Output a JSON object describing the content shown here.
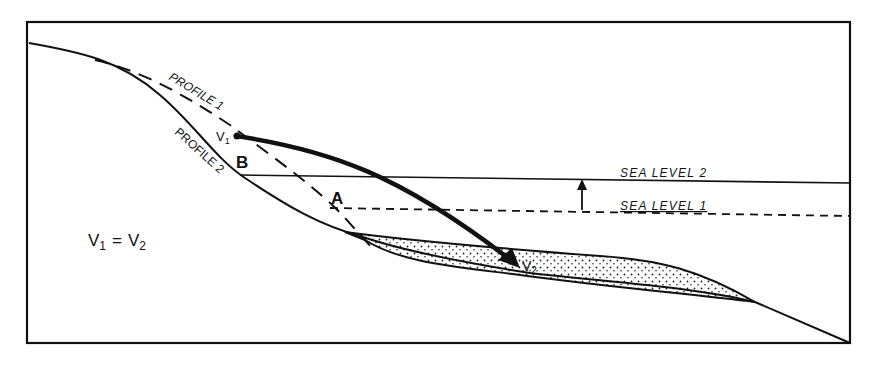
{
  "diagram": {
    "labels": {
      "profile1": "PROFILE 1",
      "profile2": "PROFILE 2",
      "sea_level_2": "SEA LEVEL 2",
      "sea_level_1": "SEA LEVEL 1",
      "point_a": "A",
      "point_b": "B",
      "v1": "V",
      "v1_sub": "1",
      "v2": "V",
      "v2_sub": "2",
      "equation_v": "V",
      "equation_sub1": "1",
      "equation_eq": "=",
      "equation_v2": "V",
      "equation_sub2": "2"
    },
    "colors": {
      "ink": "#111111",
      "background": "#ffffff"
    }
  }
}
